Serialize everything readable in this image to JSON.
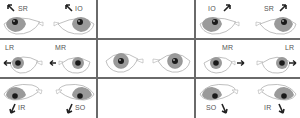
{
  "diagram": {
    "colors": {
      "grid": "#6a6a6a",
      "iris": "#9a9a9a",
      "pupil": "#1a1a1a",
      "outline": "#b0b0b0",
      "label": "#555555",
      "arrow": "#222222"
    },
    "cells": [
      {
        "id": "top-left-left",
        "muscle": "SR",
        "gaze": "up-right"
      },
      {
        "id": "top-left-right",
        "muscle": "IO",
        "gaze": "up-left"
      },
      {
        "id": "top-right-left",
        "muscle": "IO",
        "gaze": "up-right"
      },
      {
        "id": "top-right-right",
        "muscle": "SR",
        "gaze": "up-left"
      },
      {
        "id": "mid-left-left",
        "muscle": "LR",
        "gaze": "right"
      },
      {
        "id": "mid-left-right",
        "muscle": "MR",
        "gaze": "right"
      },
      {
        "id": "center-left",
        "muscle": "",
        "gaze": "primary"
      },
      {
        "id": "center-right",
        "muscle": "",
        "gaze": "primary"
      },
      {
        "id": "mid-right-left",
        "muscle": "MR",
        "gaze": "left"
      },
      {
        "id": "mid-right-right",
        "muscle": "LR",
        "gaze": "left"
      },
      {
        "id": "bot-left-left",
        "muscle": "IR",
        "gaze": "down-right"
      },
      {
        "id": "bot-left-right",
        "muscle": "SO",
        "gaze": "down-left"
      },
      {
        "id": "bot-right-left",
        "muscle": "SO",
        "gaze": "down-right"
      },
      {
        "id": "bot-right-right",
        "muscle": "IR",
        "gaze": "down-left"
      }
    ],
    "labels": {
      "tl1": "SR",
      "tl2": "IO",
      "tr1": "IO",
      "tr2": "SR",
      "ml1": "LR",
      "ml2": "MR",
      "mr1": "MR",
      "mr2": "LR",
      "bl1": "IR",
      "bl2": "SO",
      "br1": "SO",
      "br2": "IR"
    }
  }
}
